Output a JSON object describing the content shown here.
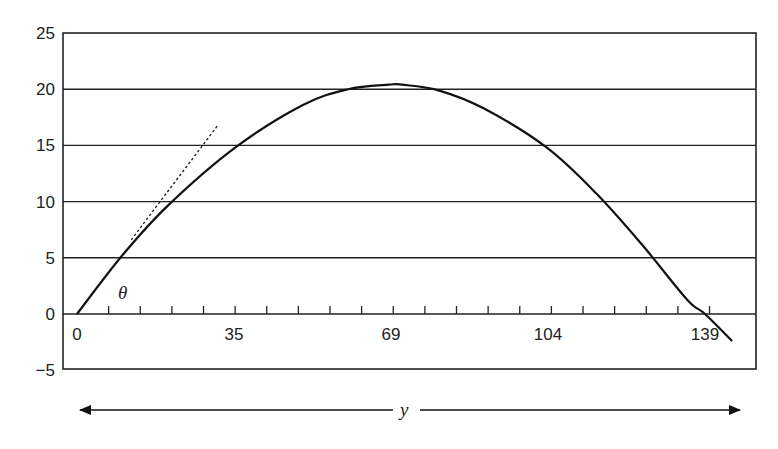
{
  "chart_data": {
    "type": "line",
    "title": "",
    "xlabel": "y",
    "ylabel": "",
    "angle_label": "θ",
    "x_ticks": [
      0,
      35,
      69,
      104,
      139
    ],
    "y_ticks": [
      25,
      20,
      15,
      10,
      5,
      0,
      -5
    ],
    "y_tick_labels": [
      "25",
      "20",
      "15",
      "10",
      "5",
      "0",
      "−5"
    ],
    "x_tick_labels": [
      "0",
      "35",
      "69",
      "104",
      "139"
    ],
    "xlim": [
      -3,
      153
    ],
    "ylim": [
      -5,
      25
    ],
    "grid": "horizontal",
    "minor_ticks_per_interval": 5,
    "series": [
      {
        "name": "trajectory",
        "style": "solid",
        "x": [
          0,
          10,
          20,
          35,
          50,
          60,
          69,
          72,
          80,
          90,
          104,
          115,
          125,
          135,
          139,
          145
        ],
        "y": [
          0,
          5.2,
          9.6,
          14.8,
          18.6,
          20.0,
          20.4,
          20.4,
          19.9,
          18.3,
          14.8,
          10.7,
          6.2,
          1.3,
          0,
          -2.4
        ]
      },
      {
        "name": "launch-angle tangent",
        "style": "dotted",
        "x": [
          12,
          31
        ],
        "y": [
          6.6,
          16.7
        ]
      }
    ],
    "annotations": [
      {
        "text": "θ",
        "x": 12,
        "y": 1.8
      },
      {
        "text": "y",
        "description": "double-headed arrow spanning horizontal range"
      }
    ]
  },
  "axis": {
    "range_label": "y",
    "angle_label": "θ"
  }
}
